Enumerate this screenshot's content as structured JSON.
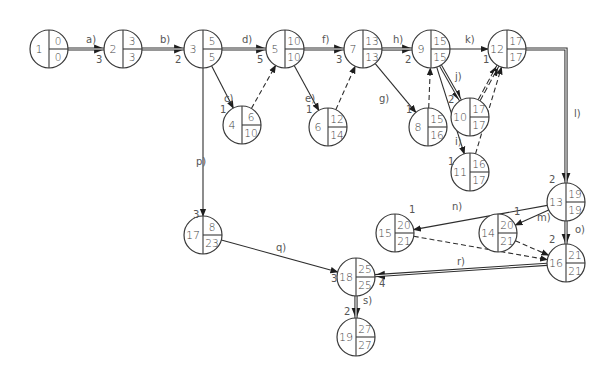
{
  "diagram": {
    "node_radius": 19,
    "nodes": [
      {
        "id": "1",
        "x": 49,
        "y": 49,
        "early": "0",
        "late": "0"
      },
      {
        "id": "2",
        "x": 123,
        "y": 49,
        "early": "3",
        "late": "3"
      },
      {
        "id": "3",
        "x": 203,
        "y": 49,
        "early": "5",
        "late": "5"
      },
      {
        "id": "5",
        "x": 285,
        "y": 49,
        "early": "10",
        "late": "10"
      },
      {
        "id": "7",
        "x": 363,
        "y": 49,
        "early": "13",
        "late": "13"
      },
      {
        "id": "9",
        "x": 431,
        "y": 49,
        "early": "15",
        "late": "15"
      },
      {
        "id": "12",
        "x": 507,
        "y": 49,
        "early": "17",
        "late": "17"
      },
      {
        "id": "4",
        "x": 242,
        "y": 125,
        "early": "6",
        "late": "10"
      },
      {
        "id": "6",
        "x": 328,
        "y": 127,
        "early": "12",
        "late": "14"
      },
      {
        "id": "8",
        "x": 428,
        "y": 127,
        "early": "15",
        "late": "16"
      },
      {
        "id": "10",
        "x": 470,
        "y": 117,
        "early": "17",
        "late": "17"
      },
      {
        "id": "11",
        "x": 470,
        "y": 172,
        "early": "16",
        "late": "17"
      },
      {
        "id": "13",
        "x": 566,
        "y": 202,
        "early": "19",
        "late": "19"
      },
      {
        "id": "17",
        "x": 203,
        "y": 235,
        "early": "8",
        "late": "23"
      },
      {
        "id": "15",
        "x": 395,
        "y": 233,
        "early": "20",
        "late": "21"
      },
      {
        "id": "14",
        "x": 498,
        "y": 233,
        "early": "20",
        "late": "21"
      },
      {
        "id": "16",
        "x": 566,
        "y": 263,
        "early": "21",
        "late": "21"
      },
      {
        "id": "18",
        "x": 356,
        "y": 277,
        "early": "25",
        "late": "25"
      },
      {
        "id": "19",
        "x": 356,
        "y": 337,
        "early": "27",
        "late": "27"
      }
    ],
    "activities": [
      {
        "label": "a)",
        "from": "1",
        "to": "2",
        "duration": "3",
        "type": "critical",
        "lx": 86,
        "ly": 43,
        "dx": 96,
        "dy": 63
      },
      {
        "label": "b)",
        "from": "2",
        "to": "3",
        "duration": "2",
        "type": "critical",
        "lx": 160,
        "ly": 43,
        "dx": 175,
        "dy": 63
      },
      {
        "label": "c)",
        "from": "3",
        "to": "4",
        "duration": "1",
        "type": "normal",
        "lx": 224,
        "ly": 102,
        "dx": 220,
        "dy": 113
      },
      {
        "label": "d)",
        "from": "3",
        "to": "5",
        "duration": "5",
        "type": "critical",
        "lx": 242,
        "ly": 43,
        "dx": 257,
        "dy": 63
      },
      {
        "label": "e)",
        "from": "5",
        "to": "6",
        "duration": "1",
        "type": "normal",
        "lx": 305,
        "ly": 102,
        "dx": 306,
        "dy": 113
      },
      {
        "label": "f)",
        "from": "5",
        "to": "7",
        "duration": "3",
        "type": "critical",
        "lx": 322,
        "ly": 43,
        "dx": 336,
        "dy": 63
      },
      {
        "label": "g)",
        "from": "7",
        "to": "8",
        "duration": "1",
        "type": "normal",
        "lx": 379,
        "ly": 102,
        "dx": 406,
        "dy": 113
      },
      {
        "label": "h)",
        "from": "7",
        "to": "9",
        "duration": "2",
        "type": "critical",
        "lx": 393,
        "ly": 43,
        "dx": 405,
        "dy": 63
      },
      {
        "label": "k)",
        "from": "9",
        "to": "12",
        "duration": "1",
        "type": "normal",
        "lx": 465,
        "ly": 43,
        "dx": 483,
        "dy": 63
      },
      {
        "label": "j)",
        "from": "9",
        "to": "10",
        "duration": "2",
        "type": "critical",
        "lx": 455,
        "ly": 80,
        "dx": 448,
        "dy": 103
      },
      {
        "label": "i)",
        "from": "9",
        "to": "11",
        "duration": "1",
        "type": "normal",
        "lx": 455,
        "ly": 145,
        "dx": 448,
        "dy": 165
      },
      {
        "label": "l)",
        "from": "12",
        "to": "13",
        "duration": "2",
        "type": "critical",
        "lx": 574,
        "ly": 117,
        "dx": 549,
        "dy": 183
      },
      {
        "label": "m)",
        "from": "13",
        "to": "14",
        "duration": "1",
        "type": "normal",
        "lx": 537,
        "ly": 221,
        "dx": 514,
        "dy": 215
      },
      {
        "label": "n)",
        "from": "13",
        "to": "15",
        "duration": "1",
        "type": "normal",
        "lx": 452,
        "ly": 210,
        "dx": 409,
        "dy": 213
      },
      {
        "label": "o)",
        "from": "13",
        "to": "16",
        "duration": "2",
        "type": "critical",
        "lx": 575,
        "ly": 233,
        "dx": 549,
        "dy": 243
      },
      {
        "label": "p)",
        "from": "3",
        "to": "17",
        "duration": "3",
        "type": "normal",
        "lx": 196,
        "ly": 165,
        "dx": 193,
        "dy": 218
      },
      {
        "label": "q)",
        "from": "17",
        "to": "18",
        "duration": "3",
        "type": "normal",
        "lx": 276,
        "ly": 251,
        "dx": 331,
        "dy": 282
      },
      {
        "label": "r)",
        "from": "16",
        "to": "18",
        "duration": "4",
        "type": "critical",
        "lx": 457,
        "ly": 265,
        "dx": 379,
        "dy": 287
      },
      {
        "label": "s)",
        "from": "18",
        "to": "19",
        "duration": "2",
        "type": "critical",
        "lx": 363,
        "ly": 304,
        "dx": 344,
        "dy": 315
      }
    ],
    "dummies": [
      {
        "from": "4",
        "to": "5",
        "type": "dashed"
      },
      {
        "from": "6",
        "to": "7",
        "type": "dashed"
      },
      {
        "from": "8",
        "to": "9",
        "type": "dashed"
      },
      {
        "from": "10",
        "to": "12",
        "type": "dashed-critical"
      },
      {
        "from": "11",
        "to": "12",
        "type": "dashed"
      },
      {
        "from": "14",
        "to": "16",
        "type": "dashed"
      },
      {
        "from": "15",
        "to": "16",
        "type": "dashed"
      }
    ],
    "colors": {
      "stroke": "#2e2e2e",
      "text": "#444444",
      "background": "#ffffff"
    }
  }
}
